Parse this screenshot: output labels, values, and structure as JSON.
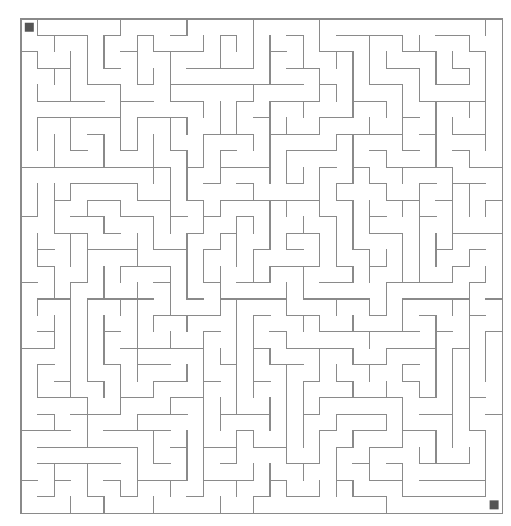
{
  "page": {
    "title_fragment": "Maze Puzzle"
  },
  "maze": {
    "cols": 29,
    "rows": 30,
    "origin_x": 21,
    "origin_y": 19,
    "cell_w": 16.6,
    "cell_h": 16.47,
    "wall_color": "#8a8a8a",
    "seed": 7,
    "start": {
      "col": 0,
      "row": 0,
      "color": "#555555",
      "label": "start-marker"
    },
    "end": {
      "col": 28,
      "row": 29,
      "color": "#555555",
      "label": "end-marker"
    }
  }
}
